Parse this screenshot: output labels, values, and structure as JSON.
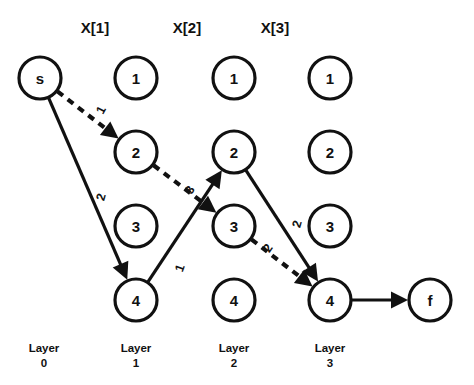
{
  "diagram": {
    "background_color": "#ffffff",
    "ink_color": "#111111",
    "column_headers": [
      {
        "label": "X[1]",
        "x": 95,
        "y": 33
      },
      {
        "label": "X[2]",
        "x": 187,
        "y": 33
      },
      {
        "label": "X[3]",
        "x": 275,
        "y": 33
      }
    ],
    "layer_labels": [
      {
        "line1": "Layer",
        "line2": "0",
        "x": 44
      },
      {
        "line1": "Layer",
        "line2": "1",
        "x": 136
      },
      {
        "line1": "Layer",
        "line2": "2",
        "x": 234
      },
      {
        "line1": "Layer",
        "line2": "3",
        "x": 330
      }
    ],
    "nodes": [
      {
        "id": "s",
        "label": "s",
        "cx": 40,
        "cy": 78,
        "r": 21
      },
      {
        "id": "c1n1",
        "label": "1",
        "cx": 136,
        "cy": 78,
        "r": 21
      },
      {
        "id": "c1n2",
        "label": "2",
        "cx": 136,
        "cy": 152,
        "r": 21
      },
      {
        "id": "c1n3",
        "label": "3",
        "cx": 136,
        "cy": 226,
        "r": 21
      },
      {
        "id": "c1n4",
        "label": "4",
        "cx": 136,
        "cy": 300,
        "r": 21
      },
      {
        "id": "c2n1",
        "label": "1",
        "cx": 234,
        "cy": 78,
        "r": 21
      },
      {
        "id": "c2n2",
        "label": "2",
        "cx": 234,
        "cy": 152,
        "r": 21
      },
      {
        "id": "c2n3",
        "label": "3",
        "cx": 234,
        "cy": 226,
        "r": 21
      },
      {
        "id": "c2n4",
        "label": "4",
        "cx": 234,
        "cy": 300,
        "r": 21
      },
      {
        "id": "c3n1",
        "label": "1",
        "cx": 330,
        "cy": 78,
        "r": 21
      },
      {
        "id": "c3n2",
        "label": "2",
        "cx": 330,
        "cy": 152,
        "r": 21
      },
      {
        "id": "c3n3",
        "label": "3",
        "cx": 330,
        "cy": 226,
        "r": 21
      },
      {
        "id": "c3n4",
        "label": "4",
        "cx": 330,
        "cy": 300,
        "r": 21
      },
      {
        "id": "f",
        "label": "f",
        "cx": 430,
        "cy": 300,
        "r": 21
      }
    ],
    "edges": [
      {
        "id": "e-s-c1n2",
        "from": "s",
        "to": "c1n2",
        "style": "dashed",
        "weight": "1",
        "weight_x": 101,
        "weight_y": 110,
        "weight_rotate": -62
      },
      {
        "id": "e-s-c1n4",
        "from": "s",
        "to": "c1n4",
        "style": "solid",
        "weight": "2",
        "weight_x": 101,
        "weight_y": 197,
        "weight_rotate": -74
      },
      {
        "id": "e-c1n2-c2n3",
        "from": "c1n2",
        "to": "c2n3",
        "style": "dashed",
        "weight": "3",
        "weight_x": 190,
        "weight_y": 190,
        "weight_rotate": -60
      },
      {
        "id": "e-c1n4-c2n2",
        "from": "c1n4",
        "to": "c2n2",
        "style": "solid",
        "weight": "1",
        "weight_x": 180,
        "weight_y": 268,
        "weight_rotate": -70
      },
      {
        "id": "e-c2n3-c3n4",
        "from": "c2n3",
        "to": "c3n4",
        "style": "dashed",
        "weight": "2",
        "weight_x": 268,
        "weight_y": 248,
        "weight_rotate": -55
      },
      {
        "id": "e-c2n2-c3n4",
        "from": "c2n2",
        "to": "c3n4",
        "style": "solid",
        "weight": "2",
        "weight_x": 297,
        "weight_y": 224,
        "weight_rotate": -74
      },
      {
        "id": "e-c3n4-f",
        "from": "c3n4",
        "to": "f",
        "style": "solid",
        "weight": "",
        "weight_x": 380,
        "weight_y": 288,
        "weight_rotate": 0
      }
    ]
  }
}
